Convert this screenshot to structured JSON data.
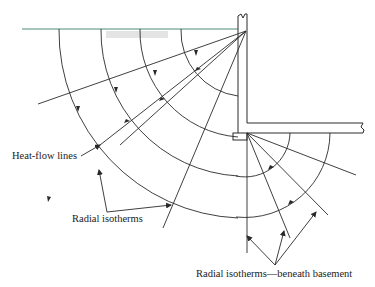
{
  "diagram": {
    "type": "basement heat-flow cross-section",
    "labels": {
      "heat_flow": "Heat-flow lines",
      "radial_isotherms": "Radial isotherms",
      "radial_isotherms_basement": "Radial isotherms—beneath basement"
    },
    "colors": {
      "line": "#2a2a2a",
      "ground": "#4a8a7a",
      "text": "#222222"
    }
  }
}
